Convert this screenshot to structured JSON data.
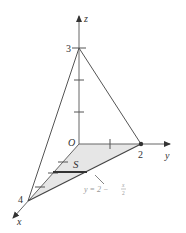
{
  "diagram": {
    "type": "3d-tetrahedron",
    "axes": {
      "x": {
        "label": "x"
      },
      "y": {
        "label": "y"
      },
      "z": {
        "label": "z"
      }
    },
    "origin_label": "O",
    "intercepts": {
      "x": "4",
      "y": "2",
      "z": "3"
    },
    "region_label": "S",
    "boundary_equation": {
      "lhs": "y = 2 −",
      "frac_num": "x",
      "frac_den": "2"
    },
    "colors": {
      "lines": "#555555",
      "axes": "#666666",
      "region_fill": "#e6e6e6",
      "equation_text": "#9a9a9a",
      "strip": "#333333"
    }
  }
}
